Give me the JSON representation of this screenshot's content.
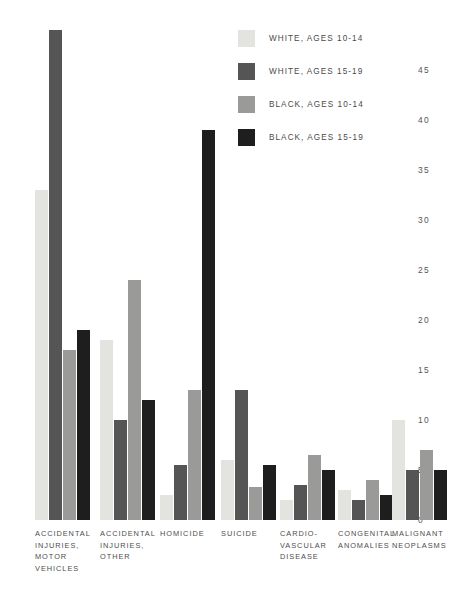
{
  "chart_data": {
    "type": "bar",
    "title": "",
    "subtitle": "",
    "xlabel": "",
    "ylabel": "",
    "ylim": [
      0,
      49
    ],
    "grid": false,
    "legend_position": "top-right",
    "yticks": [
      0,
      5,
      10,
      15,
      20,
      25,
      30,
      35,
      40,
      45
    ],
    "ytick_labels": [
      "0",
      "5",
      "10",
      "15",
      "20",
      "25",
      "30",
      "35",
      "40",
      "45"
    ],
    "categories": [
      "ACCIDENTAL INJURIES, MOTOR VEHICLES",
      "ACCIDENTAL INJURIES, OTHER",
      "HOMICIDE",
      "SUICIDE",
      "CARDIO-VASCULAR DISEASE",
      "CONGENITAL ANOMALIES",
      "MALIGNANT NEOPLASMS"
    ],
    "category_labels": [
      [
        "ACCIDENTAL",
        "INJURIES,",
        "MOTOR",
        "VEHICLES"
      ],
      [
        "ACCIDENTAL",
        "INJURIES,",
        "OTHER"
      ],
      [
        "HOMICIDE"
      ],
      [
        "SUICIDE"
      ],
      [
        "CARDIO-",
        "VASCULAR",
        "DISEASE"
      ],
      [
        "CONGENITAL",
        "ANOMALIES"
      ],
      [
        "MALIGNANT",
        "NEOPLASMS"
      ]
    ],
    "series": [
      {
        "name": "WHITE, AGES 10-14",
        "color": "#e3e3e0",
        "values": [
          33,
          18,
          2.5,
          6,
          2,
          3,
          10
        ]
      },
      {
        "name": "WHITE, AGES 15-19",
        "color": "#555555",
        "values": [
          49,
          10,
          5.5,
          13,
          3.5,
          2,
          5
        ]
      },
      {
        "name": "BLACK, AGES 10-14",
        "color": "#9a9a98",
        "values": [
          17,
          24,
          13,
          3.3,
          6.5,
          4,
          7
        ]
      },
      {
        "name": "BLACK, AGES 15-19",
        "color": "#1e1e1e",
        "values": [
          19,
          12,
          39,
          5.5,
          5,
          2.5,
          5
        ]
      }
    ]
  },
  "legend": {
    "items": [
      {
        "label": "WHITE, AGES 10-14",
        "color": "#e3e3e0"
      },
      {
        "label": "WHITE, AGES 15-19",
        "color": "#555555"
      },
      {
        "label": "BLACK, AGES 10-14",
        "color": "#9a9a98"
      },
      {
        "label": "BLACK, AGES 15-19",
        "color": "#1e1e1e"
      }
    ]
  }
}
